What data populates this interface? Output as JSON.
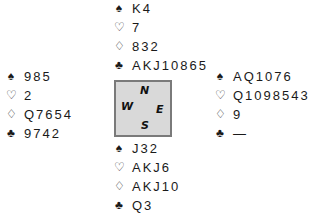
{
  "hands": {
    "north": {
      "spades": "K4",
      "hearts": "7",
      "diamonds": "832",
      "clubs": "AKJ10865"
    },
    "west": {
      "spades": "985",
      "hearts": "2",
      "diamonds": "Q7654",
      "clubs": "9742"
    },
    "east": {
      "spades": "AQ1076",
      "hearts": "Q1098543",
      "diamonds": "9",
      "clubs": "—"
    },
    "south": {
      "spades": "J32",
      "hearts": "AKJ6",
      "diamonds": "AKJ10",
      "clubs": "Q3"
    }
  },
  "suits": {
    "spades": "♠",
    "hearts": "♡",
    "diamonds": "♢",
    "clubs": "♣"
  },
  "compass": {
    "north": "N",
    "south": "S",
    "east": "E",
    "west": "W"
  },
  "colors": {
    "compass_fill": "#d9d9d9",
    "compass_border": "#7a7a7a",
    "text": "#1a1a1a"
  }
}
